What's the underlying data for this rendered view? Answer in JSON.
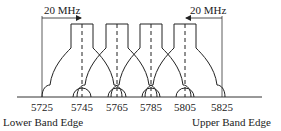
{
  "diagram": {
    "type": "channel-spectrum",
    "frequency_ticks": [
      "5725",
      "5745",
      "5765",
      "5785",
      "5805",
      "5825"
    ],
    "channel_centers": [
      "5745",
      "5765",
      "5785",
      "5805"
    ],
    "lower_edge_label": "Lower Band Edge",
    "upper_edge_label": "Upper Band Edge",
    "lower_bandwidth_label": "20 MHz",
    "upper_bandwidth_label": "20 MHz",
    "line_color": "#222222"
  }
}
